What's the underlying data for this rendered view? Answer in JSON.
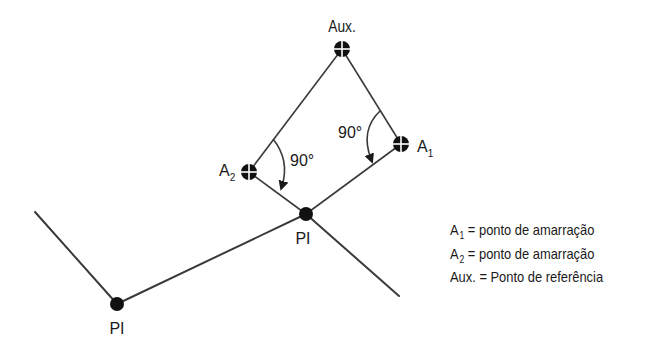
{
  "diagram": {
    "line_color": "#3a3a3a",
    "marker_color": "#111111",
    "points": {
      "aux": {
        "x": 342,
        "y": 49,
        "label": "Aux."
      },
      "a1": {
        "x": 401,
        "y": 144,
        "label": "A",
        "sub": "1"
      },
      "a2": {
        "x": 249,
        "y": 172,
        "label": "A",
        "sub": "2"
      },
      "pi_center": {
        "x": 306,
        "y": 214,
        "label": "PI"
      },
      "pi_left": {
        "x": 117,
        "y": 304,
        "label": "PI"
      }
    },
    "angles": [
      {
        "label": "90°",
        "at": "A2"
      },
      {
        "label": "90°",
        "at": "A1"
      }
    ]
  },
  "legend": {
    "items": [
      {
        "symbol": "A",
        "sub": "1",
        "text": "= ponto de amarração"
      },
      {
        "symbol": "A",
        "sub": "2",
        "text": "= ponto de amarração"
      },
      {
        "symbol": "Aux.",
        "sub": "",
        "text": "= Ponto de referência"
      }
    ]
  }
}
